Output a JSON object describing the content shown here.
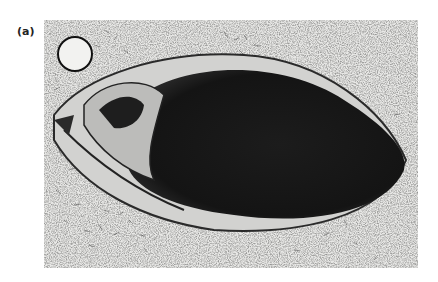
{
  "figure": {
    "panel_label": "(a)"
  }
}
